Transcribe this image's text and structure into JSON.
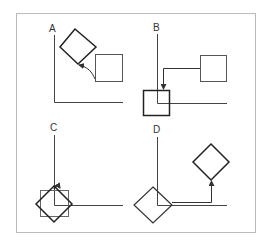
{
  "figure": {
    "frame_color": "#bbbbbb",
    "line_color": "#333333",
    "panels": [
      {
        "id": "A",
        "label": "A",
        "description": "Rotated square moved from square position via curved arrow"
      },
      {
        "id": "B",
        "label": "B",
        "description": "Square translated to origin via elbow arrow"
      },
      {
        "id": "C",
        "label": "C",
        "description": "Square rotated about origin"
      },
      {
        "id": "D",
        "label": "D",
        "description": "Rotated square translated back via elbow arrow"
      }
    ]
  }
}
